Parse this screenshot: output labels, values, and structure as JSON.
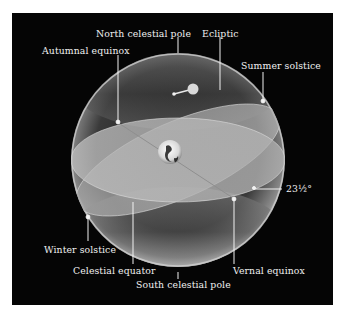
{
  "diagram": {
    "labels": {
      "north_celestial_pole": "North celestial pole",
      "ecliptic": "Ecliptic",
      "autumnal_equinox": "Autumnal equinox",
      "summer_solstice": "Summer solstice",
      "tilt_angle": "23½°",
      "winter_solstice": "Winter solstice",
      "celestial_equator": "Celestial equator",
      "vernal_equinox": "Vernal equinox",
      "south_celestial_pole": "South celestial pole"
    },
    "colors": {
      "background": "#050505",
      "label_text": "#f2f2f2",
      "equator_plane": "#b9b9b9",
      "ecliptic_plane": "#a8a8a8",
      "sphere_edge": "#cfcfcf"
    },
    "objects": [
      "Earth (center)",
      "Sun (on ecliptic)"
    ]
  }
}
